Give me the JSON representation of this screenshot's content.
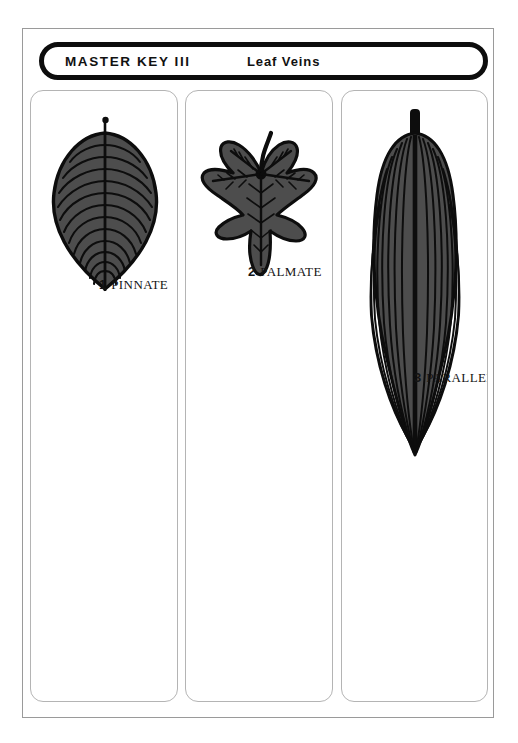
{
  "header": {
    "title": "MASTER KEY  III",
    "subtitle": "Leaf Veins"
  },
  "panels": [
    {
      "id": "pinnate",
      "number": "1",
      "name": "PINNATE",
      "icon": "pinnate-leaf-icon"
    },
    {
      "id": "palmate",
      "number": "2",
      "name": "PALMATE",
      "icon": "palmate-leaf-icon"
    },
    {
      "id": "parallel",
      "number": "3",
      "name": "PARALLEL",
      "icon": "parallel-leaf-icon"
    }
  ],
  "colors": {
    "leaf_fill": "#4d4d4d",
    "leaf_vein": "#0d0d0d",
    "leaf_outline": "#0d0d0d",
    "frame_border": "#9a9a9a",
    "panel_border": "#b4b4b4",
    "header_border": "#0d0d0d",
    "text": "#141414",
    "background": "#ffffff"
  }
}
